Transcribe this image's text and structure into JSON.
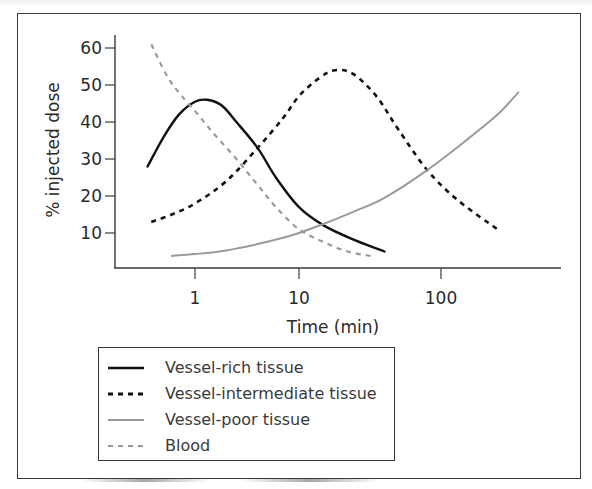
{
  "chart_data": {
    "type": "line",
    "title": "",
    "xlabel": "Time (min)",
    "ylabel": "% injected dose",
    "xscale": "log",
    "x_ticks": [
      1,
      10,
      100
    ],
    "x_tick_labels": [
      "1",
      "10",
      "100"
    ],
    "y_ticks": [
      10,
      20,
      30,
      40,
      50,
      60
    ],
    "y_tick_labels": [
      "10",
      "20",
      "30",
      "40",
      "50",
      "60"
    ],
    "xlim": [
      0.3,
      600
    ],
    "ylim": [
      0,
      65
    ],
    "grid": false,
    "legend_position": "below-left",
    "series": [
      {
        "name": "Vessel-rich tissue",
        "style": "solid",
        "color": "#111111",
        "x": [
          0.35,
          0.5,
          0.7,
          1.0,
          1.3,
          1.8,
          2.5,
          4,
          6,
          10,
          15,
          25,
          40
        ],
        "y": [
          28,
          36,
          42,
          45.5,
          46,
          44.5,
          40,
          33,
          25,
          17,
          12,
          8,
          5
        ]
      },
      {
        "name": "Vessel-intermediate tissue",
        "style": "dashed",
        "color": "#111111",
        "x": [
          0.38,
          0.6,
          1.0,
          2,
          4,
          7,
          10,
          14,
          18,
          24,
          35,
          50,
          80,
          130,
          250
        ],
        "y": [
          13,
          15,
          18,
          24,
          33,
          41,
          47,
          52,
          54,
          53,
          47,
          38,
          27,
          19,
          11
        ]
      },
      {
        "name": "Vessel-poor tissue",
        "style": "solid",
        "color": "#9a9a9a",
        "x": [
          0.6,
          1.0,
          2,
          4,
          7,
          10,
          15,
          25,
          40,
          80,
          150,
          250,
          350
        ],
        "y": [
          3.8,
          4.3,
          5.3,
          7,
          8.7,
          10,
          12.5,
          16,
          19.5,
          27,
          35,
          42,
          48
        ]
      },
      {
        "name": "Blood",
        "style": "dashed",
        "color": "#9a9a9a",
        "x": [
          0.38,
          0.55,
          0.8,
          1.0,
          1.5,
          2.5,
          4,
          6,
          10,
          15,
          22,
          32
        ],
        "y": [
          61,
          52,
          46,
          43,
          37,
          30,
          23,
          17,
          11,
          7.5,
          5,
          3.8
        ]
      }
    ]
  },
  "legend": {
    "items": [
      {
        "label": "Vessel-rich tissue",
        "swatch": "solid-black"
      },
      {
        "label": "Vessel-intermediate tissue",
        "swatch": "dashed-black"
      },
      {
        "label": "Vessel-poor tissue",
        "swatch": "solid-gray"
      },
      {
        "label": "Blood",
        "swatch": "dashed-gray"
      }
    ]
  },
  "axes": {
    "x_title": "Time (min)",
    "y_title": "% injected dose",
    "x_ticks": [
      "1",
      "10",
      "100"
    ],
    "y_ticks": [
      "60",
      "50",
      "40",
      "30",
      "20",
      "10"
    ]
  },
  "colors": {
    "black_series": "#111111",
    "gray_series": "#9a9a9a",
    "axis": "#3a3a3a",
    "text": "#2a2a2a"
  }
}
